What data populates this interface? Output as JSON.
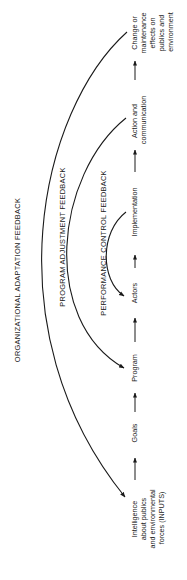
{
  "diagram": {
    "orientation": "rotated-90-ccw",
    "flow_nodes": [
      {
        "id": "inputs",
        "lines": [
          "Intelligence",
          "about publics",
          "and environmental",
          "forces (INPUTS)"
        ]
      },
      {
        "id": "goals",
        "lines": [
          "Goals"
        ]
      },
      {
        "id": "program",
        "lines": [
          "Program"
        ]
      },
      {
        "id": "actors",
        "lines": [
          "Actors"
        ]
      },
      {
        "id": "implementation",
        "lines": [
          "Implementation"
        ]
      },
      {
        "id": "action",
        "lines": [
          "Action and",
          "communication"
        ]
      },
      {
        "id": "effects",
        "lines": [
          "Change or",
          "maintenance",
          "effects on",
          "publics and",
          "environment"
        ]
      }
    ],
    "feedback_loops": [
      {
        "id": "organizational",
        "label": "ORGANIZATIONAL ADAPTATION FEEDBACK",
        "from": "effects",
        "to": "inputs"
      },
      {
        "id": "program",
        "label": "PROGRAM ADJUSTMENT FEEDBACK",
        "from": "action",
        "to": "program"
      },
      {
        "id": "performance",
        "label": "PERFORMANCE CONTROL FEEDBACK",
        "from": "implementation",
        "to": "actors"
      }
    ],
    "colors": {
      "ink": "#1a1a1a",
      "background": "#ffffff"
    }
  }
}
